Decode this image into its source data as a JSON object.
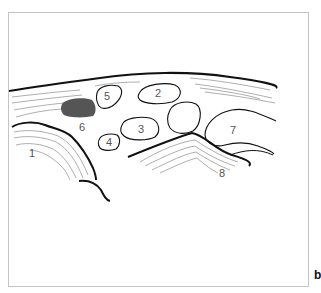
{
  "figure": {
    "panel_label": "b",
    "labels": [
      {
        "id": "1",
        "text": "1",
        "x": 33,
        "y": 157
      },
      {
        "id": "2",
        "text": "2",
        "x": 158,
        "y": 97
      },
      {
        "id": "3",
        "text": "3",
        "x": 142,
        "y": 133
      },
      {
        "id": "4",
        "text": "4",
        "x": 110,
        "y": 146
      },
      {
        "id": "5",
        "text": "5",
        "x": 107,
        "y": 98
      },
      {
        "id": "6",
        "text": "6",
        "x": 82,
        "y": 131
      },
      {
        "id": "7",
        "text": "7",
        "x": 233,
        "y": 133
      },
      {
        "id": "8",
        "text": "8",
        "x": 222,
        "y": 176
      }
    ],
    "colors": {
      "frame": "#bbbbbb",
      "outline": "#111111",
      "fiber": "#999999",
      "dark_structure": "#555555"
    }
  }
}
